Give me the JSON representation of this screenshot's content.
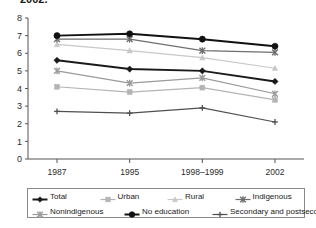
{
  "title_fragment": "2002.",
  "chart_data": {
    "type": "line",
    "title": "",
    "xlabel": "",
    "ylabel": "",
    "categories": [
      "1987",
      "1995",
      "1998–1999",
      "2002"
    ],
    "ylim": [
      0,
      8
    ],
    "yticks": [
      "0",
      "1",
      "2",
      "3",
      "4",
      "5",
      "6",
      "7",
      "8"
    ],
    "grid": false,
    "legend_position": "bottom",
    "series": [
      {
        "name": "Total",
        "marker": "diamond",
        "color": "#1a1a1a",
        "line_width": 2.0,
        "values": [
          5.6,
          5.1,
          5.0,
          4.4
        ]
      },
      {
        "name": "Urban",
        "marker": "square",
        "color": "#b4b4b4",
        "line_width": 1.2,
        "values": [
          4.1,
          3.8,
          4.05,
          3.35
        ]
      },
      {
        "name": "Rural",
        "marker": "triangle",
        "color": "#c8c8c8",
        "line_width": 1.2,
        "values": [
          6.5,
          6.15,
          5.75,
          5.15
        ]
      },
      {
        "name": "Indigenous",
        "marker": "x",
        "color": "#6e6e6e",
        "line_width": 1.2,
        "values": [
          6.8,
          6.8,
          6.15,
          6.05
        ]
      },
      {
        "name": "Nonindigenous",
        "marker": "x",
        "color": "#9a9a9a",
        "line_width": 1.2,
        "values": [
          5.0,
          4.3,
          4.6,
          3.7
        ]
      },
      {
        "name": "No education",
        "marker": "circle",
        "color": "#111111",
        "line_width": 2.0,
        "values": [
          7.0,
          7.1,
          6.8,
          6.4
        ]
      },
      {
        "name": "Secondary and postsecondary",
        "marker": "plus",
        "color": "#4f4f4f",
        "line_width": 1.2,
        "values": [
          2.7,
          2.6,
          2.9,
          2.1
        ]
      }
    ]
  },
  "legend": {
    "row1": [
      "Total",
      "Urban",
      "Rural",
      "Indigenous"
    ],
    "row2": [
      "Nonindigenous",
      "No education",
      "Secondary and postsecondary"
    ]
  }
}
